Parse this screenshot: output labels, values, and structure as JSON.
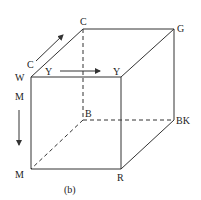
{
  "diagram": {
    "type": "color-cube",
    "caption": "(b)",
    "vertices": {
      "W": {
        "label": "W",
        "x": 31,
        "y": 77
      },
      "C": {
        "label": "C",
        "x": 83,
        "y": 29
      },
      "G": {
        "label": "G",
        "x": 174,
        "y": 29
      },
      "Y": {
        "label": "Y",
        "x": 121,
        "y": 77
      },
      "M": {
        "label": "M",
        "x": 31,
        "y": 169
      },
      "B": {
        "label": "B",
        "x": 83,
        "y": 120
      },
      "BK": {
        "label": "BK",
        "x": 174,
        "y": 120
      },
      "R": {
        "label": "R",
        "x": 121,
        "y": 169
      }
    },
    "axes": [
      {
        "label": "C",
        "direction": "diagonal-up-right"
      },
      {
        "label": "Y",
        "direction": "right"
      },
      {
        "label": "M",
        "direction": "down"
      }
    ],
    "colors": {
      "line": "#333333",
      "background": "#ffffff"
    }
  }
}
